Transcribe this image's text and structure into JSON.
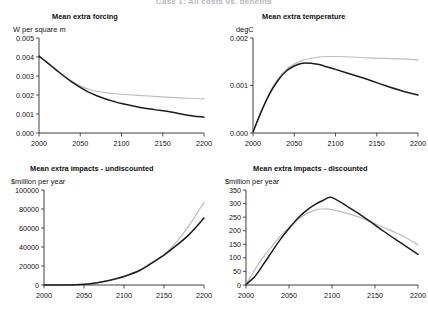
{
  "header": {
    "clipped_title": "Case 1: All costs vs. benefits"
  },
  "figure": {
    "x_min": 2000,
    "x_max": 2200,
    "x_ticks": [
      2000,
      2050,
      2100,
      2150,
      2200
    ],
    "series_colors": {
      "dark": "#1c1c1c",
      "light": "#bdbdbd"
    },
    "series_names": [
      "Series A (dark)",
      "Series B (light)"
    ]
  },
  "chart_data": [
    {
      "id": "mean-extra-forcing",
      "type": "line",
      "title": "Mean extra forcing",
      "ylabel": "W per square m",
      "xlabel": "",
      "ylim": [
        0.0,
        0.005
      ],
      "y_ticks": [
        0.0,
        0.001,
        0.002,
        0.003,
        0.004,
        0.005
      ],
      "y_tick_labels": [
        "0.000",
        "0.001",
        "0.002",
        "0.003",
        "0.004",
        "0.005"
      ],
      "xlim": [
        2000,
        2200
      ],
      "x_ticks": [
        2000,
        2050,
        2100,
        2150,
        2200
      ],
      "x_tick_labels": [
        "2000",
        "2050",
        "2100",
        "2150",
        "2200"
      ],
      "grid": false,
      "legend": "none",
      "x": [
        2000,
        2010,
        2020,
        2030,
        2040,
        2050,
        2060,
        2070,
        2080,
        2090,
        2100,
        2120,
        2140,
        2160,
        2180,
        2200
      ],
      "series": [
        {
          "name": "Series A (dark)",
          "color": "#1c1c1c",
          "values": [
            0.00405,
            0.0037,
            0.00335,
            0.003,
            0.00268,
            0.0024,
            0.00215,
            0.00196,
            0.0018,
            0.00167,
            0.00155,
            0.00137,
            0.00123,
            0.0011,
            0.00094,
            0.00083
          ]
        },
        {
          "name": "Series B (light)",
          "color": "#bdbdbd",
          "values": [
            0.00405,
            0.0037,
            0.00336,
            0.00303,
            0.00273,
            0.00248,
            0.0023,
            0.00219,
            0.00213,
            0.00208,
            0.00204,
            0.00198,
            0.00193,
            0.00188,
            0.00183,
            0.0018
          ]
        }
      ]
    },
    {
      "id": "mean-extra-temperature",
      "type": "line",
      "title": "Mean extra temperature",
      "ylabel": "degC",
      "xlabel": "",
      "ylim": [
        0.0,
        0.002
      ],
      "y_ticks": [
        0.0,
        0.001,
        0.002
      ],
      "y_tick_labels": [
        "0.000",
        "0.001",
        "0.002"
      ],
      "xlim": [
        2000,
        2200
      ],
      "x_ticks": [
        2000,
        2050,
        2100,
        2150,
        2200
      ],
      "x_tick_labels": [
        "2000",
        "2050",
        "2100",
        "2150",
        "2200"
      ],
      "grid": false,
      "legend": "none",
      "x": [
        2000,
        2010,
        2020,
        2030,
        2040,
        2050,
        2060,
        2070,
        2080,
        2090,
        2100,
        2120,
        2140,
        2160,
        2180,
        2200
      ],
      "series": [
        {
          "name": "Series A (dark)",
          "color": "#1c1c1c",
          "values": [
            2e-05,
            0.00045,
            0.00082,
            0.0011,
            0.0013,
            0.00141,
            0.00147,
            0.00147,
            0.00144,
            0.00139,
            0.00134,
            0.00123,
            0.00112,
            0.001,
            0.00089,
            0.0008
          ]
        },
        {
          "name": "Series B (light)",
          "color": "#bdbdbd",
          "values": [
            2e-05,
            0.00046,
            0.00085,
            0.00113,
            0.00133,
            0.00145,
            0.00153,
            0.00157,
            0.0016,
            0.00161,
            0.00161,
            0.0016,
            0.00158,
            0.00157,
            0.00156,
            0.00154
          ]
        }
      ]
    },
    {
      "id": "mean-extra-impacts-undiscounted",
      "type": "line",
      "title": "Mean extra impacts - undiscounted",
      "ylabel": "$million per year",
      "xlabel": "",
      "ylim": [
        0,
        100000
      ],
      "y_ticks": [
        0,
        20000,
        40000,
        60000,
        80000,
        100000
      ],
      "y_tick_labels": [
        "0",
        "20000",
        "40000",
        "60000",
        "80000",
        "100000"
      ],
      "xlim": [
        2000,
        2200
      ],
      "x_ticks": [
        2000,
        2050,
        2100,
        2150,
        2200
      ],
      "x_tick_labels": [
        "2000",
        "2050",
        "2100",
        "2150",
        "2200"
      ],
      "grid": false,
      "legend": "none",
      "x": [
        2000,
        2020,
        2040,
        2050,
        2060,
        2080,
        2100,
        2120,
        2140,
        2150,
        2160,
        2180,
        2200
      ],
      "series": [
        {
          "name": "Series A (dark)",
          "color": "#1c1c1c",
          "values": [
            0,
            50,
            300,
            700,
            1600,
            4500,
            9000,
            15500,
            26000,
            31500,
            38000,
            52000,
            70500
          ]
        },
        {
          "name": "Series B (light)",
          "color": "#bdbdbd",
          "values": [
            0,
            50,
            320,
            750,
            1700,
            4700,
            9300,
            16000,
            26500,
            32000,
            40000,
            61000,
            87000
          ]
        }
      ]
    },
    {
      "id": "mean-extra-impacts-discounted",
      "type": "line",
      "title": "Mean extra impacts - discounted",
      "ylabel": "$million per year",
      "xlabel": "",
      "ylim": [
        0,
        350
      ],
      "y_ticks": [
        0,
        50,
        100,
        150,
        200,
        250,
        300,
        350
      ],
      "y_tick_labels": [
        "0",
        "50",
        "100",
        "150",
        "200",
        "250",
        "300",
        "350"
      ],
      "xlim": [
        2000,
        2200
      ],
      "x_ticks": [
        2000,
        2050,
        2100,
        2150,
        2200
      ],
      "x_tick_labels": [
        "2000",
        "2050",
        "2100",
        "2150",
        "2200"
      ],
      "grid": false,
      "legend": "none",
      "x": [
        2000,
        2010,
        2020,
        2030,
        2040,
        2050,
        2060,
        2070,
        2080,
        2090,
        2100,
        2120,
        2140,
        2160,
        2180,
        2200
      ],
      "series": [
        {
          "name": "Series A (dark)",
          "color": "#1c1c1c",
          "values": [
            2,
            30,
            75,
            122,
            168,
            208,
            245,
            274,
            296,
            312,
            322,
            285,
            244,
            198,
            155,
            113
          ]
        },
        {
          "name": "Series B (light)",
          "color": "#bdbdbd",
          "values": [
            2,
            55,
            103,
            142,
            180,
            212,
            240,
            262,
            276,
            280,
            278,
            262,
            240,
            212,
            184,
            148
          ]
        }
      ]
    }
  ]
}
